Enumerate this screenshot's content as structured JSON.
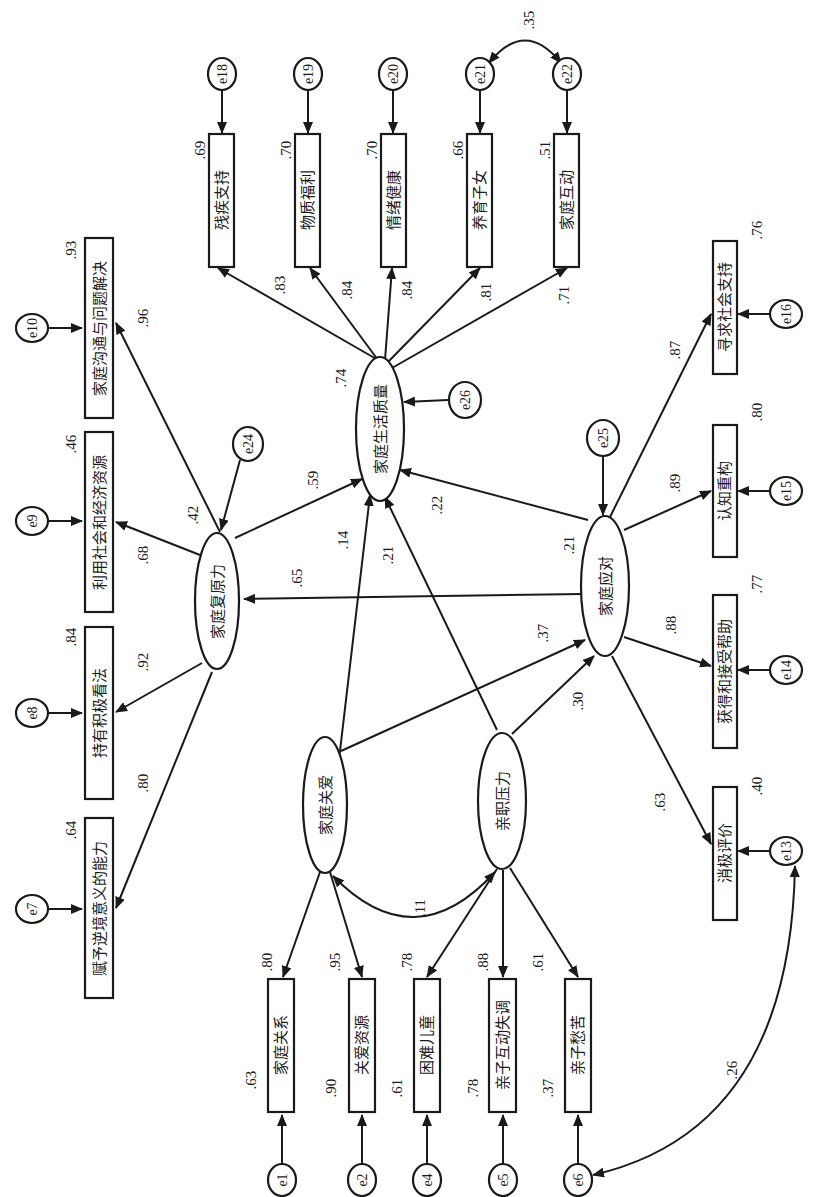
{
  "diagram": {
    "type": "structural-equation-model",
    "orientation": "rotated-90-clockwise",
    "colors": {
      "ink": "#1a1a1a",
      "background": "#ffffff"
    },
    "latent": [
      {
        "id": "L_resilience",
        "label": "家庭复原力",
        "r2": ".42",
        "error": "e24"
      },
      {
        "id": "L_quality",
        "label": "家庭生活质量",
        "r2": ".74",
        "error": "e26"
      },
      {
        "id": "L_coping",
        "label": "家庭应对",
        "r2": ".21",
        "error": "e25"
      },
      {
        "id": "L_care",
        "label": "家庭关爱"
      },
      {
        "id": "L_stress",
        "label": "亲职压力"
      }
    ],
    "indicators": [
      {
        "id": "i_e1",
        "label": "家庭关系",
        "error": "e1",
        "r2": ".63",
        "loading": ".80",
        "factor": "家庭关爱"
      },
      {
        "id": "i_e2",
        "label": "关爱资源",
        "error": "e2",
        "r2": ".90",
        "loading": ".95",
        "factor": "家庭关爱"
      },
      {
        "id": "i_e4",
        "label": "困难儿童",
        "error": "e4",
        "r2": ".61",
        "loading": ".78",
        "factor": "亲职压力"
      },
      {
        "id": "i_e5",
        "label": "亲子互动失调",
        "error": "e5",
        "r2": ".78",
        "loading": ".88",
        "factor": "亲职压力"
      },
      {
        "id": "i_e6",
        "label": "亲子愁苦",
        "error": "e6",
        "r2": ".37",
        "loading": ".61",
        "factor": "亲职压力"
      },
      {
        "id": "i_e7",
        "label": "赋予逆境意义的能力",
        "error": "e7",
        "r2": ".64",
        "loading": ".80",
        "factor": "家庭复原力"
      },
      {
        "id": "i_e8",
        "label": "持有积极看法",
        "error": "e8",
        "r2": ".84",
        "loading": ".92",
        "factor": "家庭复原力"
      },
      {
        "id": "i_e9",
        "label": "利用社会和经济资源",
        "error": "e9",
        "r2": ".46",
        "loading": ".68",
        "factor": "家庭复原力"
      },
      {
        "id": "i_e10",
        "label": "家庭沟通与问题解决",
        "error": "e10",
        "r2": ".93",
        "loading": ".96",
        "factor": "家庭复原力"
      },
      {
        "id": "i_e13",
        "label": "消极评价",
        "error": "e13",
        "r2": ".40",
        "loading": ".63",
        "factor": "家庭应对"
      },
      {
        "id": "i_e14",
        "label": "获得和接受帮助",
        "error": "e14",
        "r2": ".77",
        "loading": ".88",
        "factor": "家庭应对"
      },
      {
        "id": "i_e15",
        "label": "认知重构",
        "error": "e15",
        "r2": ".80",
        "loading": ".89",
        "factor": "家庭应对"
      },
      {
        "id": "i_e16",
        "label": "寻求社会支持",
        "error": "e16",
        "r2": ".76",
        "loading": ".87",
        "factor": "家庭应对"
      },
      {
        "id": "i_e18",
        "label": "残疾支持",
        "error": "e18",
        "r2": ".69",
        "loading": ".83",
        "factor": "家庭生活质量"
      },
      {
        "id": "i_e19",
        "label": "物质福利",
        "error": "e19",
        "r2": ".70",
        "loading": ".84",
        "factor": "家庭生活质量"
      },
      {
        "id": "i_e20",
        "label": "情绪健康",
        "error": "e20",
        "r2": ".70",
        "loading": ".84",
        "factor": "家庭生活质量"
      },
      {
        "id": "i_e21",
        "label": "养育子女",
        "error": "e21",
        "r2": ".66",
        "loading": ".81",
        "factor": "家庭生活质量"
      },
      {
        "id": "i_e22",
        "label": "家庭互动",
        "error": "e22",
        "r2": ".51",
        "loading": ".71",
        "factor": "家庭生活质量"
      }
    ],
    "paths": [
      {
        "from": "家庭复原力",
        "to": "家庭生活质量",
        "coef": ".59"
      },
      {
        "from": "家庭关爱",
        "to": "家庭生活质量",
        "coef": ".14"
      },
      {
        "from": "亲职压力",
        "to": "家庭生活质量",
        "coef": ".21"
      },
      {
        "from": "家庭应对",
        "to": "家庭生活质量",
        "coef": ".22"
      },
      {
        "from": "家庭应对",
        "to": "家庭复原力",
        "coef": ".65"
      },
      {
        "from": "家庭关爱",
        "to": "家庭应对",
        "coef": ".37"
      },
      {
        "from": "亲职压力",
        "to": "家庭应对",
        "coef": ".30"
      }
    ],
    "covariances": [
      {
        "between": [
          "家庭关爱",
          "亲职压力"
        ],
        "coef": ".11"
      },
      {
        "between": [
          "e21",
          "e22"
        ],
        "coef": ".35"
      },
      {
        "between": [
          "e6",
          "e13"
        ],
        "coef": ".26"
      }
    ]
  }
}
